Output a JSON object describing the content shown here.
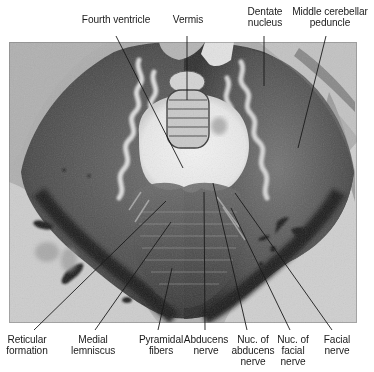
{
  "figure": {
    "colors": {
      "background": "#ffffff",
      "photo_light": "#e6e6e6",
      "photo_mid": "#8a8a8a",
      "photo_dark": "#2e2e2e",
      "leader_line": "#1a1a1a",
      "label_text": "#1a1a1a"
    }
  },
  "labels_top": [
    {
      "id": "fourth-ventricle",
      "lines": [
        "Fourth ventricle"
      ]
    },
    {
      "id": "vermis",
      "lines": [
        "Vermis"
      ]
    },
    {
      "id": "dentate-nucleus",
      "lines": [
        "Dentate",
        "nucleus"
      ]
    },
    {
      "id": "middle-cerebellar-peduncle",
      "lines": [
        "Middle cerebellar",
        "peduncle"
      ]
    }
  ],
  "labels_bottom": [
    {
      "id": "reticular-formation",
      "lines": [
        "Reticular",
        "formation"
      ]
    },
    {
      "id": "medial-lemniscus",
      "lines": [
        "Medial",
        "lemniscus"
      ]
    },
    {
      "id": "pyramidal-fibers",
      "lines": [
        "Pyramidal",
        "fibers"
      ]
    },
    {
      "id": "abducens-nerve",
      "lines": [
        "Abducens",
        "nerve"
      ]
    },
    {
      "id": "nuc-of-abducens-nerve",
      "lines": [
        "Nuc. of",
        "abducens",
        "nerve"
      ]
    },
    {
      "id": "nuc-of-facial-nerve",
      "lines": [
        "Nuc. of",
        "facial",
        "nerve"
      ]
    },
    {
      "id": "facial-nerve",
      "lines": [
        "Facial",
        "nerve"
      ]
    }
  ]
}
